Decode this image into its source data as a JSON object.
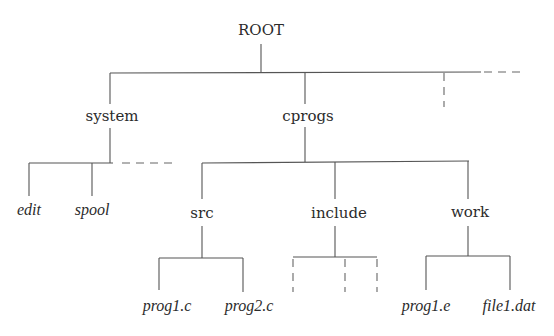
{
  "diagram": {
    "type": "directory-tree",
    "root": {
      "label": "ROOT",
      "children": [
        {
          "label": "system",
          "kind": "directory",
          "children": [
            {
              "label": "edit",
              "kind": "file"
            },
            {
              "label": "spool",
              "kind": "file"
            }
          ],
          "more_children_indicated": true
        },
        {
          "label": "cprogs",
          "kind": "directory",
          "children": [
            {
              "label": "src",
              "kind": "directory",
              "children": [
                {
                  "label": "prog1.c",
                  "kind": "file"
                },
                {
                  "label": "prog2.c",
                  "kind": "file"
                }
              ]
            },
            {
              "label": "include",
              "kind": "directory",
              "children": [],
              "unnamed_children_count": 3
            },
            {
              "label": "work",
              "kind": "directory",
              "children": [
                {
                  "label": "prog1.e",
                  "kind": "file"
                },
                {
                  "label": "file1.dat",
                  "kind": "file"
                }
              ]
            }
          ]
        }
      ],
      "more_children_indicated": true
    },
    "colors": {
      "line": "#555555",
      "text": "#2b2b2b",
      "background": "#ffffff"
    }
  },
  "labels": {
    "root": "ROOT",
    "system": "system",
    "cprogs": "cprogs",
    "edit": "edit",
    "spool": "spool",
    "src": "src",
    "include": "include",
    "work": "work",
    "prog1_c": "prog1.c",
    "prog2_c": "prog2.c",
    "prog1_e": "prog1.e",
    "file1_dat": "file1.dat"
  }
}
